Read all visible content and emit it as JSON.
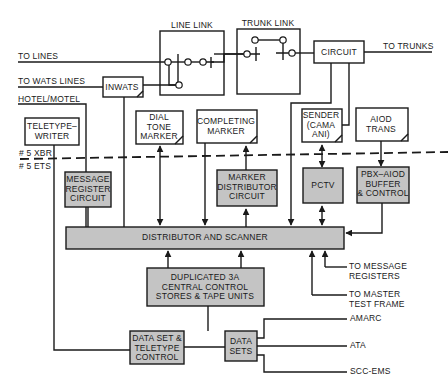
{
  "diagram": {
    "colors": {
      "line": "#1a1a1a",
      "shaded_box": "#c4c4c4",
      "background": "#ffffff"
    },
    "divider": {
      "upper_label": "# 5 XBR",
      "lower_label": "# 5 ETS"
    },
    "inputs": {
      "to_lines": "TO LINES",
      "to_wats_lines": "TO WATS LINES",
      "hotel_motel": "HOTEL/MOTEL",
      "to_trunks": "TO TRUNKS",
      "to_message_registers_1": "TO MESSAGE",
      "to_message_registers_2": "REGISTERS",
      "to_master_test_frame_1": "TO MASTER",
      "to_master_test_frame_2": "TEST FRAME",
      "amarc": "AMARC",
      "ata": "ATA",
      "scc_ems": "SCC-EMS"
    },
    "blocks": {
      "line_link": "LINE LINK",
      "trunk_link": "TRUNK LINK",
      "circuit": "CIRCUIT",
      "inwats": "INWATS",
      "teletypewriter_1": "TELETYPE–",
      "teletypewriter_2": "WRITER",
      "dial_tone_marker_1": "DIAL",
      "dial_tone_marker_2": "TONE",
      "dial_tone_marker_3": "MARKER",
      "completing_marker_1": "COMPLETING",
      "completing_marker_2": "MARKER",
      "sender_1": "SENDER",
      "sender_2": "(CAMA",
      "sender_3": "ANI)",
      "aiod_trans_1": "AIOD",
      "aiod_trans_2": "TRANS",
      "message_register_1": "MESSAGE",
      "message_register_2": "REGISTER",
      "message_register_3": "CIRCUIT",
      "marker_distributor_1": "MARKER",
      "marker_distributor_2": "DISTRIBUTOR",
      "marker_distributor_3": "CIRCUIT",
      "pctv": "PCTV",
      "pbx_aiod_1": "PBX–AIOD",
      "pbx_aiod_2": "BUFFER",
      "pbx_aiod_3": "& CONTROL",
      "distributor_scanner": "DISTRIBUTOR AND SCANNER",
      "central_control_1": "DUPLICATED 3A",
      "central_control_2": "CENTRAL CONTROL",
      "central_control_3": "STORES & TAPE UNITS",
      "data_set_tty_1": "DATA SET &",
      "data_set_tty_2": "TELETYPE",
      "data_set_tty_3": "CONTROL",
      "data_sets_1": "DATA",
      "data_sets_2": "SETS"
    }
  }
}
